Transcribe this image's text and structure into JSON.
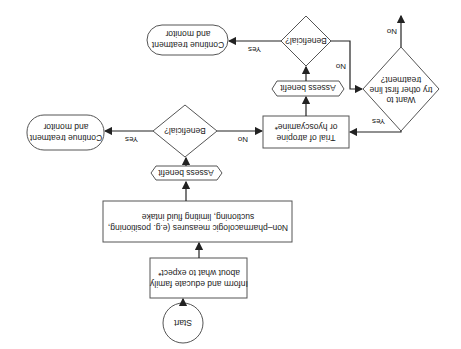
{
  "orientation": "rotated-180",
  "nodes": {
    "start": {
      "label": "Start"
    },
    "inform": {
      "lines": [
        "Inform and educate family",
        "about what to expect*"
      ]
    },
    "nonpharm": {
      "lines": [
        "Non–pharmacologic measures (e.g. positioning,",
        "suctioning, limiting fluid intake"
      ]
    },
    "assess1": {
      "label": "Assess benefit"
    },
    "beneficial1": {
      "label": "Beneficial?"
    },
    "continue1": {
      "lines": [
        "Continue treatment",
        "and monitor"
      ]
    },
    "trial": {
      "lines": [
        "Trial of atropine",
        "or hyoscyamine*"
      ]
    },
    "assess2": {
      "label": "Assess benefit"
    },
    "beneficial2": {
      "label": "Beneficial?"
    },
    "continue2": {
      "lines": [
        "Continue treatment",
        "and monitor"
      ]
    },
    "want": {
      "lines": [
        "Want to",
        "try other first line",
        "treatment?"
      ]
    }
  },
  "edges": {
    "b1_yes": "Yes",
    "b1_no": "No",
    "b2_yes": "Yes",
    "b2_no": "No",
    "want_yes": "Yes",
    "want_no": "No"
  }
}
